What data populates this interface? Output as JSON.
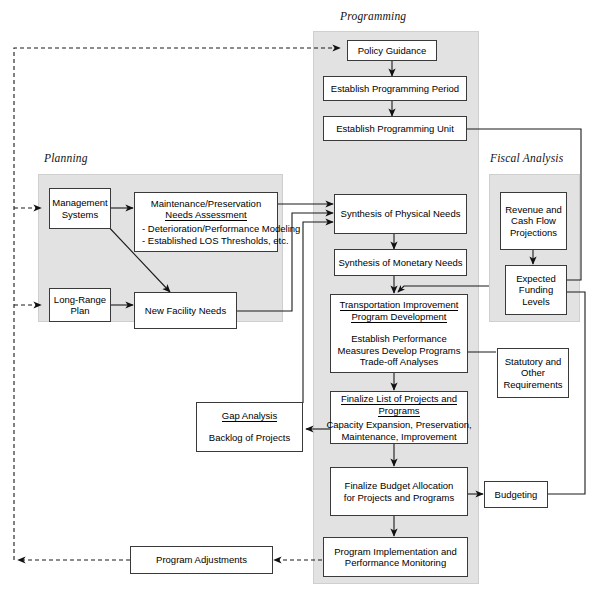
{
  "diagram": {
    "panels": [
      {
        "key": "planning",
        "label": "Planning"
      },
      {
        "key": "programming",
        "label": "Programming"
      },
      {
        "key": "fiscal",
        "label": "Fiscal Analysis"
      }
    ]
  },
  "nodes": {
    "policy_guidance": {
      "lines": [
        "Policy Guidance"
      ]
    },
    "establish_period": {
      "lines": [
        "Establish Programming Period"
      ]
    },
    "establish_unit": {
      "lines": [
        "Establish Programming Unit"
      ]
    },
    "management_systems": {
      "lines": [
        "Management",
        "Systems"
      ]
    },
    "long_range_plan": {
      "lines": [
        "Long-Range",
        "Plan"
      ]
    },
    "maintenance_needs": {
      "title_lines": [
        "Maintenance/Preservation",
        "Needs Assessment"
      ],
      "bullets": [
        "- Deterioration/Performance Modeling",
        "- Established LOS Thresholds, etc."
      ]
    },
    "new_facility_needs": {
      "lines": [
        "New Facility Needs"
      ]
    },
    "synthesis_physical": {
      "lines": [
        "Synthesis of Physical Needs"
      ]
    },
    "synthesis_monetary": {
      "lines": [
        "Synthesis of Monetary Needs"
      ]
    },
    "tip_development": {
      "title_lines": [
        "Transportation Improvement",
        "Program Development"
      ],
      "body_lines": [
        "Establish Performance",
        "Measures Develop Programs",
        "Trade-off Analyses"
      ]
    },
    "finalize_list": {
      "title_lines": [
        "Finalize List of Projects and",
        "Programs"
      ],
      "body_lines": [
        "Capacity Expansion, Preservation,",
        "Maintenance, Improvement"
      ]
    },
    "finalize_budget": {
      "lines": [
        "Finalize Budget Allocation",
        "for Projects and Programs"
      ]
    },
    "program_implementation": {
      "lines": [
        "Program Implementation and",
        "Performance Monitoring"
      ]
    },
    "gap_analysis": {
      "title_lines": [
        "Gap Analysis"
      ],
      "body_lines": [
        "Backlog of Projects"
      ]
    },
    "revenue_projections": {
      "lines": [
        "Revenue and",
        "Cash Flow",
        "Projections"
      ]
    },
    "expected_funding": {
      "lines": [
        "Expected",
        "Funding",
        "Levels"
      ]
    },
    "statutory_requirements": {
      "lines": [
        "Statutory and",
        "Other",
        "Requirements"
      ]
    },
    "budgeting": {
      "lines": [
        "Budgeting"
      ]
    },
    "program_adjustments": {
      "lines": [
        "Program Adjustments"
      ]
    }
  },
  "colors": {
    "panel_fill": "#e2e2e2",
    "node_fill": "#ffffff",
    "stroke": "#3a3a3a",
    "background": "#ffffff"
  }
}
